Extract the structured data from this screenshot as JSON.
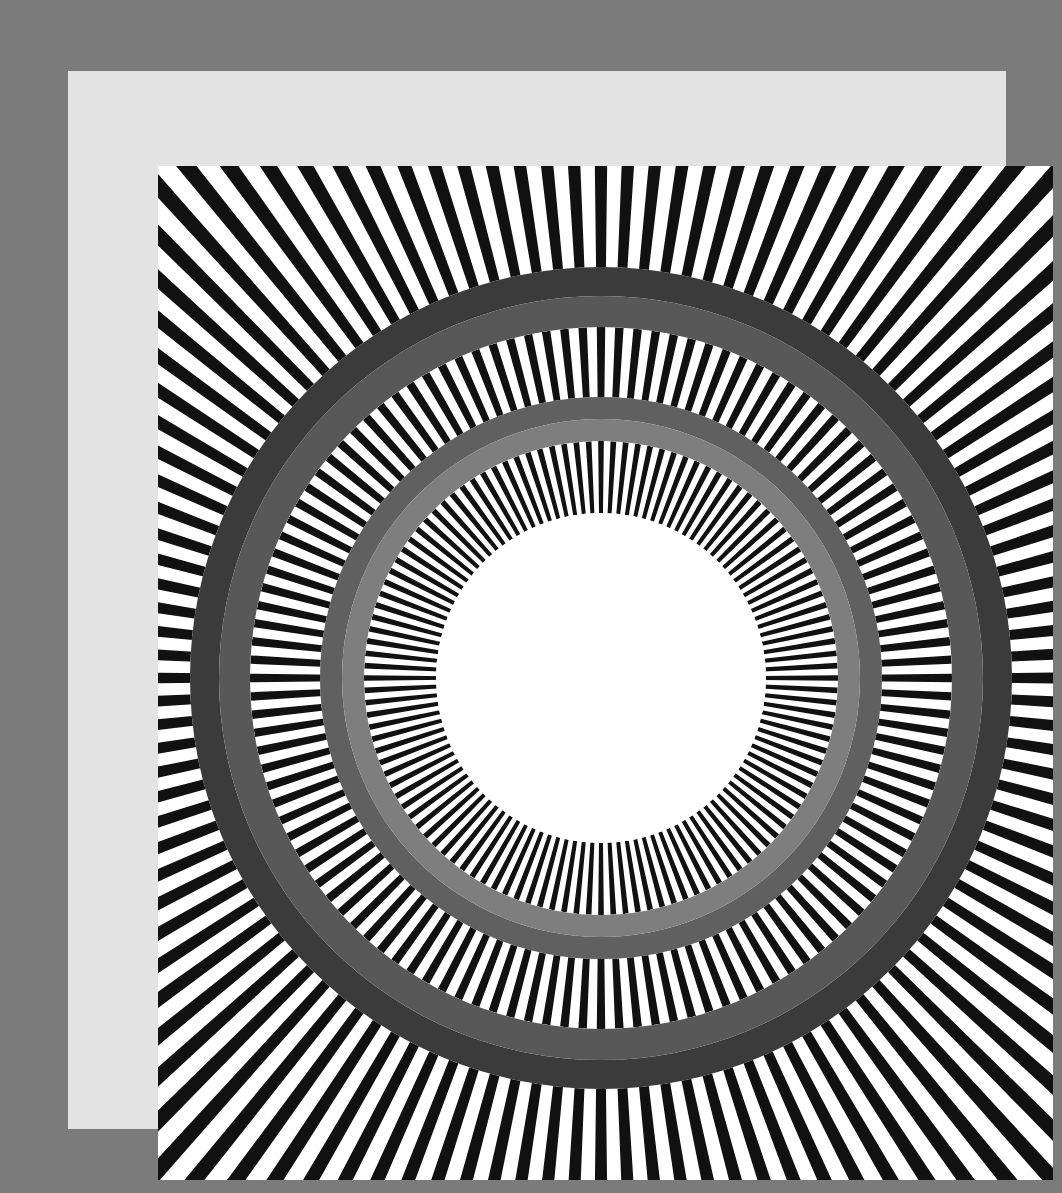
{
  "artwork": {
    "title": "",
    "background_color": "#7b7b7b",
    "mat_color": "#e3e3e3",
    "canvas_color": "#ffffff",
    "stripe_color": "#111111",
    "center": {
      "x": 443,
      "y": 512
    },
    "ray_count": 120,
    "ray_duty": 0.46,
    "bands": [
      {
        "name": "outer-rays",
        "inner_radius": 411,
        "outer_radius": 1000
      },
      {
        "name": "middle-rays",
        "inner_radius": 281,
        "outer_radius": 351
      },
      {
        "name": "inner-rays",
        "inner_radius": 165,
        "outer_radius": 237
      }
    ],
    "rings": [
      {
        "name": "outer-ring-dark",
        "inner_radius": 382,
        "outer_radius": 411,
        "color": "#3b3b3b"
      },
      {
        "name": "outer-ring-medium",
        "inner_radius": 351,
        "outer_radius": 382,
        "color": "#585858"
      },
      {
        "name": "inner-ring-dark",
        "inner_radius": 259,
        "outer_radius": 281,
        "color": "#606060"
      },
      {
        "name": "inner-ring-light",
        "inner_radius": 237,
        "outer_radius": 259,
        "color": "#7e7e7e"
      }
    ],
    "center_disc": {
      "radius": 165,
      "color": "#ffffff"
    }
  }
}
